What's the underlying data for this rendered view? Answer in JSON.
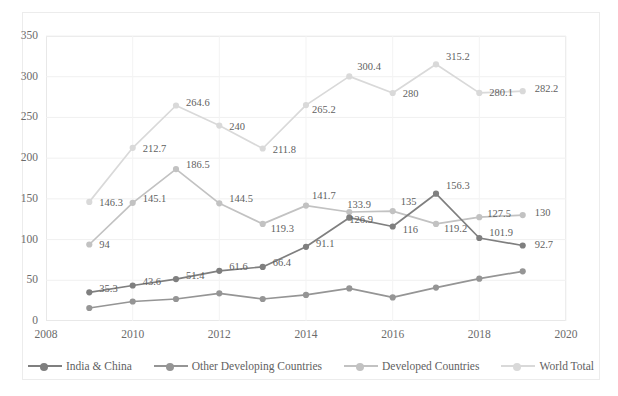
{
  "chart_data": {
    "type": "line",
    "title": "",
    "xlabel": "",
    "ylabel": "",
    "xlim": [
      2008,
      2020
    ],
    "ylim": [
      0,
      350
    ],
    "xticks": [
      "2008",
      "2010",
      "2012",
      "2014",
      "2016",
      "2018",
      "2020"
    ],
    "yticks": [
      "0",
      "50",
      "100",
      "150",
      "200",
      "250",
      "300",
      "350"
    ],
    "grid": true,
    "legend_position": "bottom",
    "x": [
      2009,
      2010,
      2011,
      2012,
      2013,
      2014,
      2015,
      2016,
      2017,
      2018,
      2019
    ],
    "series": [
      {
        "name": "India & China",
        "color": "#7f7f7f",
        "values": [
          35.3,
          43.6,
          51.4,
          61.6,
          66.4,
          91.1,
          126.9,
          116,
          156.3,
          101.9,
          92.7
        ],
        "labels": [
          "35.3",
          "43.6",
          "51.4",
          "61.6",
          "66.4",
          "91.1",
          "126.9",
          "116",
          "156.3",
          "101.9",
          "92.7"
        ]
      },
      {
        "name": "Other Developing Countries",
        "color": "#959595",
        "values": [
          16,
          24,
          27,
          34,
          27,
          32,
          40,
          29,
          41,
          52,
          61
        ],
        "labels": [
          "",
          "",
          "",
          "",
          "",
          "",
          "",
          "",
          "",
          "",
          ""
        ]
      },
      {
        "name": "Developed Countries",
        "color": "#c2c2c2",
        "values": [
          94,
          145.1,
          186.5,
          144.5,
          119.3,
          141.7,
          133.9,
          135,
          119.2,
          127.5,
          130
        ],
        "labels": [
          "94",
          "145.1",
          "186.5",
          "144.5",
          "119.3",
          "141.7",
          "133.9",
          "135",
          "119.2",
          "127.5",
          "130"
        ]
      },
      {
        "name": "World Total",
        "color": "#d9d9d9",
        "values": [
          146.3,
          212.7,
          264.6,
          240,
          211.8,
          265.2,
          300.4,
          280,
          315.2,
          280.1,
          282.2
        ],
        "labels": [
          "146.3",
          "212.7",
          "264.6",
          "240",
          "211.8",
          "265.2",
          "300.4",
          "280",
          "315.2",
          "280.1",
          "282.2"
        ]
      }
    ]
  }
}
